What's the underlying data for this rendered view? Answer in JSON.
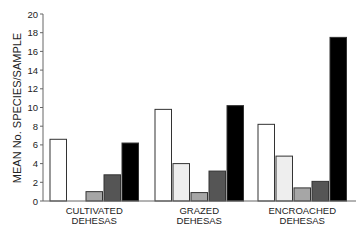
{
  "chart_data": {
    "type": "bar",
    "title": "",
    "xlabel": "",
    "ylabel": "MEAN No. SPECIES/SAMPLE",
    "ylim": [
      0,
      20
    ],
    "yticks": [
      0,
      2,
      4,
      6,
      8,
      10,
      12,
      14,
      16,
      18,
      20
    ],
    "grid": false,
    "legend": null,
    "categories": [
      "CULTIVATED DEHESAS",
      "GRAZED DEHESAS",
      "ENCROACHED DEHESAS"
    ],
    "category_lines": [
      [
        "CULTIVATED",
        "DEHESAS"
      ],
      [
        "GRAZED",
        "DEHESAS"
      ],
      [
        "ENCROACHED",
        "DEHESAS"
      ]
    ],
    "series": [
      {
        "name": "series-1",
        "color": "#ffffff",
        "values": [
          6.6,
          9.8,
          8.2
        ]
      },
      {
        "name": "series-2",
        "color": "#eeeeee",
        "values": [
          0,
          4.0,
          4.8
        ]
      },
      {
        "name": "series-3",
        "color": "#a6a6a6",
        "values": [
          1.0,
          0.9,
          1.4
        ]
      },
      {
        "name": "series-4",
        "color": "#555555",
        "values": [
          2.8,
          3.2,
          2.1
        ]
      },
      {
        "name": "series-5",
        "color": "#000000",
        "values": [
          6.2,
          10.2,
          17.5
        ]
      }
    ]
  }
}
